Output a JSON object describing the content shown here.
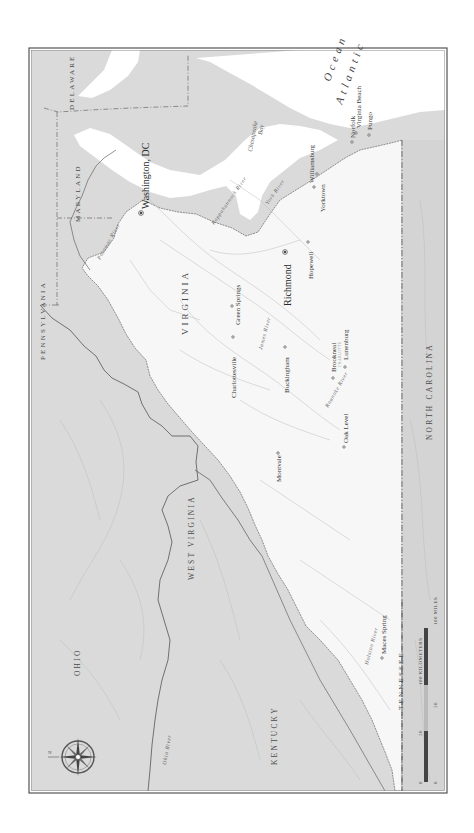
{
  "map": {
    "orientation": "rotated-90-ccw",
    "colors": {
      "page": "#ffffff",
      "frame": "#555555",
      "virginia_land": "#f7f7f7",
      "other_land": "#d9d9d9",
      "water": "#ffffff",
      "border": "#555555",
      "rivers": "#b8b8b8"
    },
    "states": {
      "delaware": "Delaware",
      "maryland": "Maryland",
      "pennsylvania": "Pennsylvania",
      "virginia": "Virginia",
      "west_virginia": "West Virginia",
      "ohio": "Ohio",
      "kentucky": "Kentucky",
      "tennessee": "Tennessee",
      "north_carolina": "North Carolina"
    },
    "water": {
      "ocean_line1": "Atlantic",
      "ocean_line2": "Ocean",
      "bay_line1": "Chesapeake",
      "bay_line2": "Bay"
    },
    "rivers": {
      "potomac": "Potomac River",
      "rappahannock": "Rappahannock River",
      "york": "York River",
      "james": "James River",
      "roanoke": "Roanoke River",
      "holston": "Holston River",
      "ohio": "Ohio River"
    },
    "cities": {
      "washington": "Washington, DC",
      "richmond": "Richmond",
      "williamsburg": "Williamsburg",
      "yorktown": "Yorktown",
      "norfolk": "Norfolk",
      "virginia_beach": "Virginia Beach",
      "pungo": "Pungo",
      "hopewell": "Hopewell",
      "green_springs": "Green Springs",
      "charlottesville": "Charlottesville",
      "buckingham": "Buckingham",
      "brookneal": "Brookneal",
      "charlotte": "Charlotte",
      "lunenburg": "Lunenburg",
      "montvale": "Montvale",
      "oak_level": "Oak Level",
      "maces_spring": "Maces Spring"
    },
    "scale_bar": {
      "km_label": "100 Kilometers",
      "miles_label": "100 Miles",
      "km_ticks": [
        "0",
        "50"
      ],
      "mile_ticks": [
        "0",
        "50"
      ]
    },
    "compass": "compass-rose"
  }
}
